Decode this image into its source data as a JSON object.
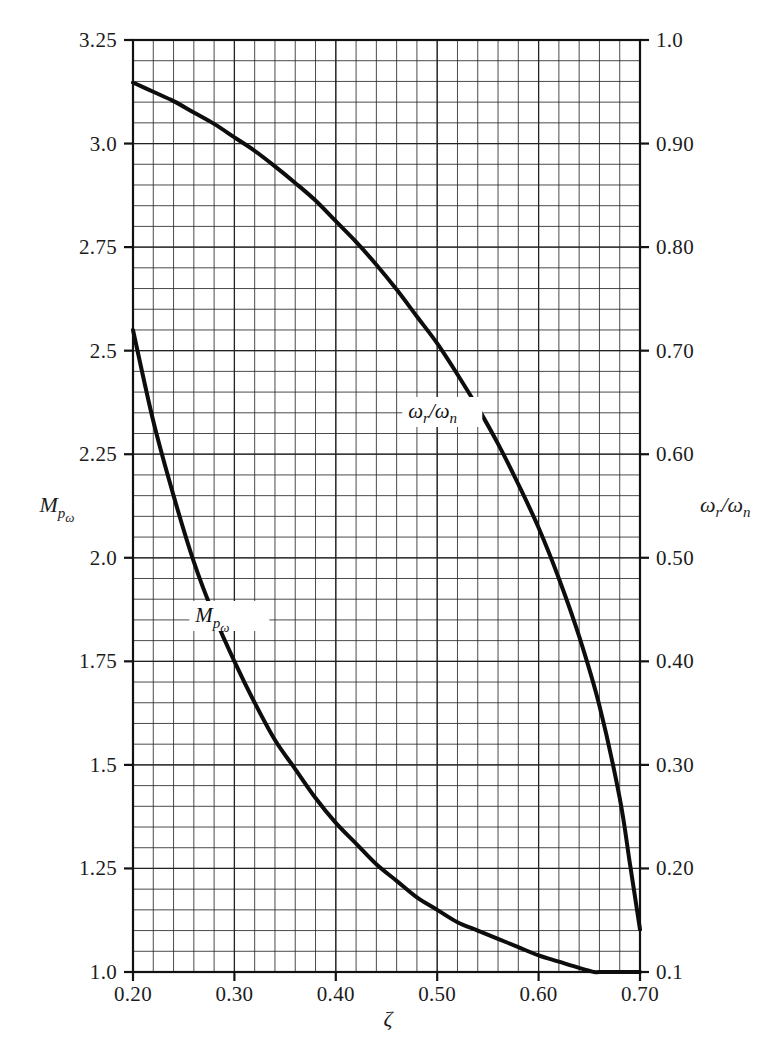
{
  "chart_data": {
    "type": "line",
    "title": "",
    "subtitle": "",
    "xlabel": "ζ",
    "ylabel": "M",
    "ylabel_sub": "p",
    "ylabel_subsub": "ω",
    "y2label": "ω",
    "y2label_sub": "r",
    "y2label_mid": "/ω",
    "y2label_sub2": "n",
    "xlim": [
      0.2,
      0.7
    ],
    "ylim": [
      1.0,
      3.25
    ],
    "y2lim": [
      0.1,
      1.0
    ],
    "grid": true,
    "grid_minor_x_step": 0.02,
    "grid_minor_y_step": 0.05,
    "grid_major_x_step": 0.1,
    "grid_major_y_step": 0.25,
    "legend_position": "inline-annotations",
    "xticks": [
      0.2,
      0.3,
      0.4,
      0.5,
      0.6,
      0.7
    ],
    "xtick_labels": [
      "0.20",
      "0.30",
      "0.40",
      "0.50",
      "0.60",
      "0.70"
    ],
    "yticks": [
      1.0,
      1.25,
      1.5,
      1.75,
      2.0,
      2.25,
      2.5,
      2.75,
      3.0,
      3.25
    ],
    "ytick_labels": [
      "1.0",
      "1.25",
      "1.5",
      "1.75",
      "2.0",
      "2.25",
      "2.5",
      "2.75",
      "3.0",
      "3.25"
    ],
    "y2ticks": [
      0.1,
      0.2,
      0.3,
      0.4,
      0.5,
      0.6,
      0.7,
      0.8,
      0.9,
      1.0
    ],
    "y2tick_labels": [
      "0.1",
      "0.20",
      "0.30",
      "0.40",
      "0.50",
      "0.60",
      "0.70",
      "0.80",
      "0.90",
      "1.0"
    ],
    "series": [
      {
        "name": "ωr/ωn",
        "axis": "right",
        "annotation": "ωr/ωn",
        "annotation_x": 0.505,
        "annotation_y": 0.635,
        "x": [
          0.2,
          0.22,
          0.24,
          0.26,
          0.28,
          0.3,
          0.32,
          0.34,
          0.36,
          0.38,
          0.4,
          0.42,
          0.44,
          0.46,
          0.48,
          0.5,
          0.52,
          0.54,
          0.56,
          0.58,
          0.6,
          0.62,
          0.64,
          0.66,
          0.68,
          0.69,
          0.7
        ],
        "values": [
          0.959,
          0.95,
          0.941,
          0.93,
          0.919,
          0.906,
          0.893,
          0.878,
          0.862,
          0.845,
          0.825,
          0.805,
          0.783,
          0.759,
          0.733,
          0.707,
          0.677,
          0.645,
          0.61,
          0.571,
          0.529,
          0.48,
          0.424,
          0.357,
          0.268,
          0.205,
          0.141
        ]
      },
      {
        "name": "Mpω",
        "axis": "left",
        "annotation": "Mpω",
        "annotation_x": 0.295,
        "annotation_y": 1.845,
        "x": [
          0.2,
          0.22,
          0.24,
          0.26,
          0.28,
          0.3,
          0.32,
          0.34,
          0.36,
          0.38,
          0.4,
          0.42,
          0.44,
          0.46,
          0.48,
          0.5,
          0.52,
          0.54,
          0.56,
          0.58,
          0.6,
          0.62,
          0.64,
          0.655,
          0.66,
          0.68,
          0.7
        ],
        "values": [
          2.55,
          2.33,
          2.15,
          1.99,
          1.86,
          1.75,
          1.65,
          1.56,
          1.49,
          1.42,
          1.36,
          1.31,
          1.26,
          1.22,
          1.18,
          1.15,
          1.12,
          1.1,
          1.08,
          1.06,
          1.04,
          1.025,
          1.01,
          1.0,
          1.0,
          1.0,
          1.0
        ]
      }
    ]
  }
}
